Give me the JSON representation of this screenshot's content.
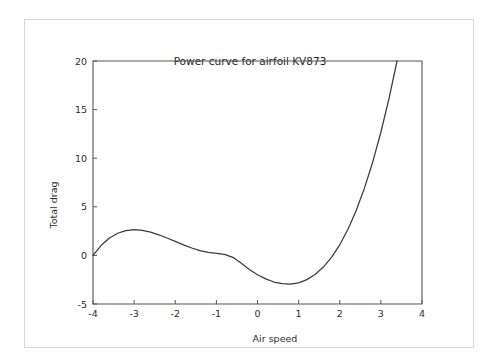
{
  "figure": {
    "title": "Power curve for airfoil KV873",
    "background_color": "#ffffff",
    "card_border_color": "#d8d8d8",
    "curve_color": "#3a3a3a",
    "axis_color": "#555555"
  },
  "chart_data": {
    "type": "line",
    "title": "Power curve for airfoil KV873",
    "xlabel": "Air speed",
    "ylabel": "Total drag",
    "xlim": [
      -4,
      4
    ],
    "ylim": [
      -5,
      20
    ],
    "xticks": [
      -4,
      -3,
      -2,
      -1,
      0,
      1,
      2,
      3,
      4
    ],
    "xticklabels": [
      "-4",
      "-3",
      "-2",
      "-1",
      "0",
      "1",
      "2",
      "3",
      "4"
    ],
    "yticks": [
      -5,
      0,
      5,
      10,
      15,
      20
    ],
    "yticklabels": [
      "-5",
      "0",
      "5",
      "10",
      "15",
      "20"
    ],
    "grid": false,
    "legend": null,
    "series": [
      {
        "name": "Total drag",
        "color": "#3a3a3a",
        "linewidth": 1.25,
        "x": [
          -4.0,
          -3.8,
          -3.6,
          -3.4,
          -3.2,
          -3.0,
          -2.8,
          -2.6,
          -2.4,
          -2.2,
          -2.0,
          -1.8,
          -1.6,
          -1.4,
          -1.2,
          -1.0,
          -0.8,
          -0.6,
          -0.4,
          -0.2,
          0.0,
          0.2,
          0.4,
          0.6,
          0.8,
          1.0,
          1.2,
          1.4,
          1.6,
          1.8,
          2.0,
          2.2,
          2.4,
          2.6,
          2.8,
          3.0,
          3.2,
          3.4,
          3.6,
          3.8,
          4.0
        ],
        "y": [
          0.0,
          1.04,
          1.79,
          2.28,
          2.55,
          2.64,
          2.57,
          2.39,
          2.12,
          1.79,
          1.44,
          1.09,
          0.76,
          0.49,
          0.3,
          0.2,
          0.11,
          -0.2,
          -0.79,
          -1.45,
          -1.99,
          -2.42,
          -2.74,
          -2.9,
          -2.95,
          -2.82,
          -2.49,
          -1.96,
          -1.2,
          -0.2,
          1.09,
          2.69,
          4.62,
          6.92,
          9.59,
          12.67,
          16.18,
          20.14,
          24.57,
          29.51,
          19.5
        ],
        "annotations": [
          {
            "label": "start",
            "x": -4.0,
            "y": 0.0
          },
          {
            "label": "local maximum",
            "x": -2.7,
            "y": 2.55
          },
          {
            "label": "local minimum",
            "x": 0.8,
            "y": -2.95
          },
          {
            "label": "end",
            "x": 4.0,
            "y": 19.5
          }
        ]
      }
    ]
  }
}
